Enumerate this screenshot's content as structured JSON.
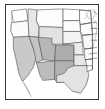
{
  "figure": {
    "kind": "choropleth-map",
    "region": "United States",
    "background_color": "#ffffff",
    "frame": {
      "visible": true,
      "border_color": "#3a3a3a",
      "border_width_px": 1
    }
  },
  "chart_data": {
    "type": "heatmap",
    "title": "",
    "subtitle": "",
    "xlabel": "",
    "ylabel": "",
    "legend": {
      "visible": false,
      "position": "none"
    },
    "grid": false,
    "projection": "albers-usa",
    "geography": "us-states",
    "outline_color": "#4a4a4a",
    "unshaded_color": "#ffffff",
    "shade_scale": [
      "#ffffff",
      "#ededed",
      "#dcdcdc",
      "#cacaca",
      "#b8b8b8",
      "#a6a6a6"
    ],
    "categories": [
      "WA",
      "OR",
      "ID",
      "MT",
      "WY",
      "CA",
      "NV",
      "UT",
      "CO",
      "AZ",
      "NM",
      "ND",
      "SD",
      "NE",
      "KS",
      "OK",
      "TX",
      "MN",
      "IA",
      "MO",
      "AR",
      "LA",
      "WI",
      "IL",
      "MI",
      "IN",
      "OH",
      "KY",
      "TN",
      "MS",
      "AL"
    ],
    "values": [
      0.0,
      0.05,
      0.38,
      0.1,
      0.42,
      0.62,
      0.66,
      0.78,
      0.88,
      0.72,
      0.82,
      0.0,
      0.08,
      0.2,
      0.3,
      0.34,
      0.4,
      0.0,
      0.05,
      0.1,
      0.08,
      0.06,
      0.0,
      0.0,
      0.0,
      0.0,
      0.0,
      0.0,
      0.0,
      0.0,
      0.0
    ]
  },
  "states": [
    {
      "name": "Washington",
      "abbr": "WA",
      "shade": "#ffffff",
      "points": "6,6 22,4 24,16 8,18"
    },
    {
      "name": "Oregon",
      "abbr": "OR",
      "shade": "#fbfbfb",
      "points": "6,18 24,16 25,32 8,33 5,26"
    },
    {
      "name": "Idaho",
      "abbr": "ID",
      "shade": "#e6e6e6",
      "points": "24,4 34,5 33,16 36,22 35,33 25,32 24,16"
    },
    {
      "name": "Montana",
      "abbr": "MT",
      "shade": "#fdfdfd",
      "points": "34,5 62,4 62,23 36,22 33,16"
    },
    {
      "name": "Wyoming",
      "abbr": "WY",
      "shade": "#e2e2e2",
      "points": "36,22 62,23 62,40 36,40"
    },
    {
      "name": "California",
      "abbr": "CA",
      "shade": "#c9c9c9",
      "points": "8,33 25,32 30,45 33,52 30,63 24,72 18,78 14,70 11,56 8,44"
    },
    {
      "name": "Nevada",
      "abbr": "NV",
      "shade": "#c4c4c4",
      "points": "25,32 35,33 40,56 33,59 30,45"
    },
    {
      "name": "Utah",
      "abbr": "UT",
      "shade": "#b6b6b6",
      "points": "35,33 50,34 50,40 54,41 53,57 40,56"
    },
    {
      "name": "Colorado",
      "abbr": "CO",
      "shade": "#acacac",
      "points": "54,41 74,41 74,57 53,57"
    },
    {
      "name": "Arizona",
      "abbr": "AZ",
      "shade": "#bcbcbc",
      "points": "33,59 53,57 53,76 40,77 37,72"
    },
    {
      "name": "New Mexico",
      "abbr": "NM",
      "shade": "#b2b2b2",
      "points": "53,57 74,57 74,79 55,79 53,76"
    },
    {
      "name": "North Dakota",
      "abbr": "ND",
      "shade": "#ffffff",
      "points": "62,4 80,5 80,16 62,16"
    },
    {
      "name": "South Dakota",
      "abbr": "SD",
      "shade": "#fcfcfc",
      "points": "62,16 80,16 81,27 62,27"
    },
    {
      "name": "Nebraska",
      "abbr": "NE",
      "shade": "#f2f2f2",
      "points": "62,27 81,27 83,38 62,40"
    },
    {
      "name": "Kansas",
      "abbr": "KS",
      "shade": "#ebebeb",
      "points": "62,40 83,38 84,51 74,51 74,41"
    },
    {
      "name": "Oklahoma",
      "abbr": "OK",
      "shade": "#e7e7e7",
      "points": "74,51 84,51 88,54 88,62 74,62 74,57"
    },
    {
      "name": "Texas",
      "abbr": "TX",
      "shade": "#e3e3e3",
      "points": "74,62 88,62 90,72 87,82 81,90 72,88 66,82 63,79 55,79 55,72 63,70 68,64"
    },
    {
      "name": "Minnesota",
      "abbr": "MN",
      "shade": "#ffffff",
      "points": "80,5 92,6 93,18 81,20 80,16"
    },
    {
      "name": "Iowa",
      "abbr": "IA",
      "shade": "#fdfdfd",
      "points": "81,20 93,18 94,30 83,31 81,27"
    },
    {
      "name": "Missouri",
      "abbr": "MO",
      "shade": "#f8f8f8",
      "points": "83,31 94,30 94,44 85,45 84,40"
    },
    {
      "name": "Arkansas",
      "abbr": "AR",
      "shade": "#fbfbfb",
      "points": "85,45 94,44 94,55 86,56"
    },
    {
      "name": "Louisiana",
      "abbr": "LA",
      "shade": "#fcfcfc",
      "points": "86,56 94,55 94,66 88,68 88,62"
    }
  ],
  "features": [
    {
      "name": "great-lakes-outline",
      "kind": "coastline"
    },
    {
      "name": "pacific-coastline",
      "kind": "coastline"
    },
    {
      "name": "gulf-coastline",
      "kind": "coastline"
    },
    {
      "name": "atlantic-coastline",
      "kind": "coastline"
    }
  ]
}
